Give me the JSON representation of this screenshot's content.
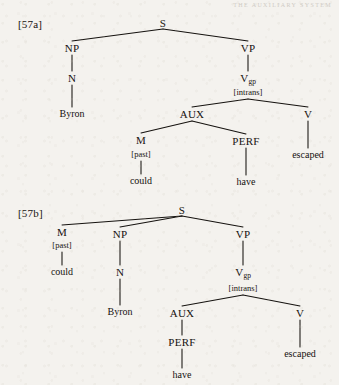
{
  "page": {
    "running_header": "THE AUXILIARY SYSTEM",
    "background_color": "#f4f2ee",
    "ink_color": "#15120f"
  },
  "examples": [
    {
      "label": "[57a]",
      "label_pos": {
        "x": 18,
        "y": 24
      },
      "sentence_words": [
        "Byron",
        "could",
        "have",
        "escaped"
      ],
      "nodes": [
        {
          "id": "s",
          "text": "S",
          "kind": "node",
          "x": 163,
          "y": 23
        },
        {
          "id": "np",
          "text": "NP",
          "kind": "node",
          "x": 72,
          "y": 48
        },
        {
          "id": "vp",
          "text": "VP",
          "kind": "node",
          "x": 248,
          "y": 48
        },
        {
          "id": "n",
          "text": "N",
          "kind": "node",
          "x": 72,
          "y": 78
        },
        {
          "id": "vgp",
          "text": "V",
          "sub": "gp",
          "kind": "node-sub",
          "x": 248,
          "y": 79
        },
        {
          "id": "vgpfeat",
          "text": "[intrans]",
          "kind": "feat",
          "x": 248,
          "y": 92
        },
        {
          "id": "byron",
          "text": "Byron",
          "kind": "leaf",
          "x": 72,
          "y": 114
        },
        {
          "id": "aux",
          "text": "AUX",
          "kind": "node",
          "x": 192,
          "y": 114
        },
        {
          "id": "v",
          "text": "V",
          "kind": "node",
          "x": 308,
          "y": 114
        },
        {
          "id": "m",
          "text": "M",
          "kind": "node",
          "x": 141,
          "y": 140
        },
        {
          "id": "mfeat",
          "text": "[past]",
          "kind": "feat",
          "x": 141,
          "y": 154
        },
        {
          "id": "perf",
          "text": "PERF",
          "kind": "node",
          "x": 246,
          "y": 141
        },
        {
          "id": "escaped",
          "text": "escaped",
          "kind": "leaf",
          "x": 308,
          "y": 155
        },
        {
          "id": "could",
          "text": "could",
          "kind": "leaf",
          "x": 141,
          "y": 181
        },
        {
          "id": "have",
          "text": "have",
          "kind": "leaf",
          "x": 246,
          "y": 182
        }
      ],
      "edges": [
        {
          "from": "s",
          "to": "np",
          "x1": 163,
          "y1": 29,
          "x2": 72,
          "y2": 41
        },
        {
          "from": "s",
          "to": "vp",
          "x1": 163,
          "y1": 29,
          "x2": 248,
          "y2": 41
        },
        {
          "from": "np",
          "to": "n",
          "x1": 72,
          "y1": 55,
          "x2": 72,
          "y2": 71
        },
        {
          "from": "vp",
          "to": "vgp",
          "x1": 248,
          "y1": 55,
          "x2": 248,
          "y2": 71
        },
        {
          "from": "n",
          "to": "byron",
          "x1": 72,
          "y1": 85,
          "x2": 72,
          "y2": 107
        },
        {
          "from": "vgp",
          "to": "aux",
          "x1": 248,
          "y1": 99,
          "x2": 192,
          "y2": 107
        },
        {
          "from": "vgp",
          "to": "v",
          "x1": 248,
          "y1": 99,
          "x2": 308,
          "y2": 107
        },
        {
          "from": "aux",
          "to": "m",
          "x1": 192,
          "y1": 121,
          "x2": 141,
          "y2": 133
        },
        {
          "from": "aux",
          "to": "perf",
          "x1": 192,
          "y1": 121,
          "x2": 246,
          "y2": 134
        },
        {
          "from": "m",
          "to": "could",
          "x1": 141,
          "y1": 161,
          "x2": 141,
          "y2": 174
        },
        {
          "from": "perf",
          "to": "have",
          "x1": 246,
          "y1": 148,
          "x2": 246,
          "y2": 175
        },
        {
          "from": "v",
          "to": "escaped",
          "x1": 308,
          "y1": 121,
          "x2": 308,
          "y2": 148
        }
      ]
    },
    {
      "label": "[57b]",
      "label_pos": {
        "x": 18,
        "y": 213
      },
      "sentence_words": [
        "could",
        "Byron",
        "have",
        "escaped"
      ],
      "nodes": [
        {
          "id": "s2",
          "text": "S",
          "kind": "node",
          "x": 182,
          "y": 210
        },
        {
          "id": "m2",
          "text": "M",
          "kind": "node",
          "x": 62,
          "y": 232
        },
        {
          "id": "m2feat",
          "text": "[past]",
          "kind": "feat",
          "x": 62,
          "y": 245
        },
        {
          "id": "np2",
          "text": "NP",
          "kind": "node",
          "x": 120,
          "y": 234
        },
        {
          "id": "vp2",
          "text": "VP",
          "kind": "node",
          "x": 243,
          "y": 234
        },
        {
          "id": "could2",
          "text": "could",
          "kind": "leaf",
          "x": 62,
          "y": 272
        },
        {
          "id": "n2",
          "text": "N",
          "kind": "node",
          "x": 120,
          "y": 272
        },
        {
          "id": "vgp2",
          "text": "V",
          "sub": "gp",
          "kind": "node-sub",
          "x": 243,
          "y": 273
        },
        {
          "id": "vgp2feat",
          "text": "[intrans]",
          "kind": "feat",
          "x": 243,
          "y": 288
        },
        {
          "id": "byron2",
          "text": "Byron",
          "kind": "leaf",
          "x": 120,
          "y": 312
        },
        {
          "id": "aux2",
          "text": "AUX",
          "kind": "node",
          "x": 182,
          "y": 313
        },
        {
          "id": "v2",
          "text": "V",
          "kind": "node",
          "x": 300,
          "y": 313
        },
        {
          "id": "perf2",
          "text": "PERF",
          "kind": "node",
          "x": 182,
          "y": 342
        },
        {
          "id": "escaped2",
          "text": "escaped",
          "kind": "leaf",
          "x": 300,
          "y": 354
        },
        {
          "id": "have2",
          "text": "have",
          "kind": "leaf",
          "x": 182,
          "y": 375
        }
      ],
      "edges": [
        {
          "from": "s2",
          "to": "m2",
          "x1": 182,
          "y1": 216,
          "x2": 62,
          "y2": 225
        },
        {
          "from": "s2",
          "to": "np2",
          "x1": 182,
          "y1": 216,
          "x2": 120,
          "y2": 227
        },
        {
          "from": "s2",
          "to": "vp2",
          "x1": 182,
          "y1": 216,
          "x2": 243,
          "y2": 227
        },
        {
          "from": "m2",
          "to": "could2",
          "x1": 62,
          "y1": 252,
          "x2": 62,
          "y2": 265
        },
        {
          "from": "np2",
          "to": "n2",
          "x1": 120,
          "y1": 241,
          "x2": 120,
          "y2": 265
        },
        {
          "from": "vp2",
          "to": "vgp2",
          "x1": 243,
          "y1": 241,
          "x2": 243,
          "y2": 265
        },
        {
          "from": "n2",
          "to": "byron2",
          "x1": 120,
          "y1": 279,
          "x2": 120,
          "y2": 305
        },
        {
          "from": "vgp2",
          "to": "aux2",
          "x1": 243,
          "y1": 295,
          "x2": 182,
          "y2": 306
        },
        {
          "from": "vgp2",
          "to": "v2",
          "x1": 243,
          "y1": 295,
          "x2": 300,
          "y2": 306
        },
        {
          "from": "aux2",
          "to": "perf2",
          "x1": 182,
          "y1": 320,
          "x2": 182,
          "y2": 335
        },
        {
          "from": "perf2",
          "to": "have2",
          "x1": 182,
          "y1": 349,
          "x2": 182,
          "y2": 368
        },
        {
          "from": "v2",
          "to": "escaped2",
          "x1": 300,
          "y1": 320,
          "x2": 300,
          "y2": 347
        }
      ]
    }
  ]
}
